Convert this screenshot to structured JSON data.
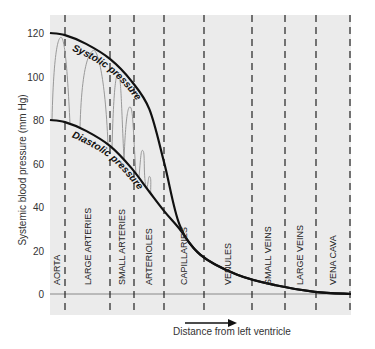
{
  "chart_data": {
    "type": "line",
    "title": "",
    "xlabel": "Distance from left ventricle",
    "ylabel": "Systemic blood pressure (mm Hg)",
    "ylim": [
      -10,
      128
    ],
    "yticks": [
      0,
      20,
      40,
      60,
      80,
      100,
      120
    ],
    "segments": [
      "AORTA",
      "LARGE ARTERIES",
      "SMALL ARTERIES",
      "ARTERIOLES",
      "CAPILLARIES",
      "VENULES",
      "SMALL VEINS",
      "LARGE VEINS",
      "VENA CAVA"
    ],
    "series": [
      {
        "name": "Systolic pressure",
        "x": [
          0,
          0.05,
          0.12,
          0.2,
          0.27,
          0.33,
          0.38,
          0.43,
          0.5,
          0.62,
          0.75,
          0.88,
          1.0
        ],
        "values": [
          120,
          119,
          115,
          108,
          98,
          85,
          60,
          32,
          18,
          9,
          4,
          1,
          0
        ]
      },
      {
        "name": "Diastolic pressure",
        "x": [
          0,
          0.05,
          0.12,
          0.2,
          0.27,
          0.33,
          0.38,
          0.43,
          0.5,
          0.62,
          0.75,
          0.88,
          1.0
        ],
        "values": [
          80,
          79,
          75,
          68,
          58,
          47,
          38,
          30,
          18,
          9,
          4,
          1,
          0
        ]
      }
    ],
    "annotations": [
      "Systolic pressure",
      "Diastolic pressure"
    ],
    "grid": false,
    "legend": "none"
  },
  "labels": {
    "systolic": "Systolic pressure",
    "diastolic": "Diastolic pressure"
  }
}
